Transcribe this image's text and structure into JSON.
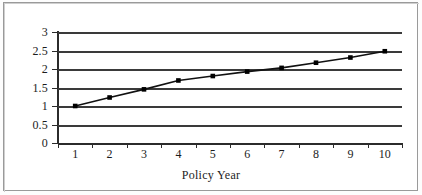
{
  "figure": {
    "background_color": "#ffffff",
    "border_color": "#9a9a9a",
    "axis_color": "#2b2b2b",
    "gridline_color": "#3a3a3a",
    "series_color": "#111111",
    "marker_color": "#000000"
  },
  "chart_data": {
    "type": "line",
    "title": "",
    "xlabel": "Policy Year",
    "ylabel": "",
    "categories": [
      "1",
      "2",
      "3",
      "4",
      "5",
      "6",
      "7",
      "8",
      "9",
      "10"
    ],
    "values": [
      1.0,
      1.23,
      1.45,
      1.69,
      1.81,
      1.93,
      2.03,
      2.17,
      2.31,
      2.48
    ],
    "series": [
      {
        "name": "Policy Year Value",
        "values": [
          1.0,
          1.23,
          1.45,
          1.69,
          1.81,
          1.93,
          2.03,
          2.17,
          2.31,
          2.48
        ]
      }
    ],
    "ylim": [
      0,
      3
    ],
    "ytick_labels": [
      "0",
      "0.5",
      "1",
      "1.5",
      "2",
      "2.5",
      "3"
    ],
    "ytick_values": [
      0,
      0.5,
      1,
      1.5,
      2,
      2.5,
      3
    ],
    "xtick_labels": [
      "1",
      "2",
      "3",
      "4",
      "5",
      "6",
      "7",
      "8",
      "9",
      "10"
    ],
    "grid": true,
    "grid_axis": "y",
    "legend": false,
    "legend_position": "none",
    "marker": "square",
    "line_style": "solid"
  }
}
